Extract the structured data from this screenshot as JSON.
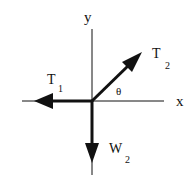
{
  "diagram": {
    "type": "free-body-diagram",
    "axes": {
      "x_label": "x",
      "y_label": "y"
    },
    "forces": [
      {
        "name": "T",
        "subscript": "1",
        "direction": "left (-x)"
      },
      {
        "name": "T",
        "subscript": "2",
        "direction": "up-right at angle θ above +x"
      },
      {
        "name": "W",
        "subscript": "2",
        "direction": "down (-y)"
      }
    ],
    "angle_label": "θ",
    "colors": {
      "stroke": "#111111",
      "background": "#ffffff"
    }
  }
}
